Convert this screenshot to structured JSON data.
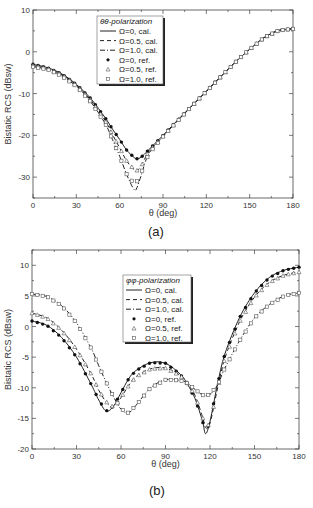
{
  "chart_data": [
    {
      "type": "line",
      "caption": "(a)",
      "xlabel": "θ (deg)",
      "ylabel": "Bistatic RCS (dBsw)",
      "xlim": [
        0,
        180
      ],
      "ylim": [
        -35,
        10
      ],
      "xticks": [
        0,
        30,
        60,
        90,
        120,
        150,
        180
      ],
      "yticks": [
        -30,
        -20,
        -10,
        0,
        10
      ],
      "legend_title": "θθ-polarization",
      "legend": [
        "Ω=0,   cal.",
        "Ω=0.5, cal.",
        "Ω=1.0, cal.",
        "Ω=0,   ref.",
        "Ω=0.5, ref.",
        "Ω=1.0, ref."
      ],
      "x": [
        0,
        10,
        20,
        30,
        40,
        50,
        55,
        60,
        65,
        70,
        72,
        75,
        80,
        90,
        100,
        110,
        120,
        130,
        140,
        150,
        160,
        170,
        180
      ],
      "series": [
        {
          "name": "Ω=0, cal.",
          "style": "solid",
          "values": [
            -3,
            -3.8,
            -5.3,
            -7.8,
            -11.2,
            -15.8,
            -18.5,
            -21,
            -23.6,
            -25.3,
            -25.6,
            -25.2,
            -23.5,
            -20,
            -16.4,
            -12.9,
            -9.4,
            -5.9,
            -2.5,
            0.6,
            3.4,
            5.1,
            5.5
          ]
        },
        {
          "name": "Ω=0.5, cal.",
          "style": "dash",
          "values": [
            -3.3,
            -4,
            -5.5,
            -8,
            -11.6,
            -16.5,
            -19.8,
            -23,
            -26.2,
            -28.2,
            -28.4,
            -27.3,
            -24,
            -20.2,
            -16.5,
            -13,
            -9.5,
            -6,
            -2.5,
            0.6,
            3.4,
            5.1,
            5.5
          ]
        },
        {
          "name": "Ω=1.0, cal.",
          "style": "dashdot",
          "values": [
            -3.6,
            -4.2,
            -5.8,
            -8.3,
            -12,
            -17.2,
            -21,
            -25,
            -29.5,
            -33,
            -32.5,
            -29.5,
            -24.5,
            -20.3,
            -16.6,
            -13,
            -9.5,
            -6,
            -2.5,
            0.6,
            3.4,
            5.1,
            5.5
          ]
        },
        {
          "name": "Ω=0, ref.",
          "marker": "filled-circle",
          "values": [
            -3,
            -3.8,
            -5.3,
            -7.8,
            -11.2,
            -15.8,
            -18.5,
            -21,
            -23.6,
            -25.3,
            -25.6,
            -25.2,
            -23.5,
            -20,
            -16.4,
            -12.9,
            -9.4,
            -5.9,
            -2.5,
            0.6,
            3.4,
            5.1,
            5.5
          ]
        },
        {
          "name": "Ω=0.5, ref.",
          "marker": "triangle",
          "values": [
            -3.3,
            -4,
            -5.5,
            -8,
            -11.6,
            -16.5,
            -19.8,
            -23,
            -26.2,
            -28.2,
            -28.4,
            -27.3,
            -24,
            -20.2,
            -16.5,
            -13,
            -9.5,
            -6,
            -2.5,
            0.6,
            3.4,
            5.1,
            5.5
          ]
        },
        {
          "name": "Ω=1.0, ref.",
          "marker": "square",
          "values": [
            -3.6,
            -4.2,
            -5.8,
            -8.3,
            -12,
            -17.2,
            -21,
            -25,
            -29.5,
            -31.5,
            -31,
            -29,
            -24.5,
            -20.3,
            -16.6,
            -13,
            -9.5,
            -6,
            -2.5,
            0.6,
            3.4,
            5.1,
            5.5
          ]
        }
      ]
    },
    {
      "type": "line",
      "caption": "(b)",
      "xlabel": "θ (deg)",
      "ylabel": "Bistatic RCS (dBsw)",
      "xlim": [
        0,
        180
      ],
      "ylim": [
        -20,
        12.5
      ],
      "xticks": [
        0,
        30,
        60,
        90,
        120,
        150,
        180
      ],
      "yticks": [
        -20,
        -15,
        -10,
        -5,
        0,
        5,
        10
      ],
      "legend_title": "φφ-polarization",
      "legend": [
        "Ω=0,   cal.",
        "Ω=0.5, cal.",
        "Ω=1.0, cal.",
        "Ω=0,   ref.",
        "Ω=0.5, ref.",
        "Ω=1.0, ref."
      ],
      "x": [
        0,
        10,
        20,
        30,
        40,
        45,
        50,
        55,
        60,
        65,
        70,
        80,
        90,
        100,
        105,
        110,
        115,
        117,
        120,
        125,
        130,
        140,
        150,
        160,
        170,
        180
      ],
      "series": [
        {
          "name": "Ω=0, cal.",
          "style": "solid",
          "values": [
            0.9,
            0.2,
            -1.8,
            -5,
            -9.5,
            -12,
            -13.8,
            -13,
            -10.8,
            -8.6,
            -7.2,
            -5.9,
            -6,
            -7.8,
            -9.5,
            -11.8,
            -15.5,
            -17.5,
            -15.5,
            -9.5,
            -4.5,
            1.5,
            5.5,
            8,
            9.2,
            9.7
          ]
        },
        {
          "name": "Ω=0.5, cal.",
          "style": "dash",
          "values": [
            2.2,
            1.4,
            -0.6,
            -3.7,
            -7.8,
            -10.4,
            -12.3,
            -13.2,
            -11.6,
            -9.7,
            -8.2,
            -6.9,
            -6.8,
            -8,
            -9.3,
            -11.3,
            -14.8,
            -16.5,
            -15.8,
            -10.2,
            -5.2,
            0.8,
            4.8,
            7.2,
            8.4,
            8.9
          ]
        },
        {
          "name": "Ω=1.0, cal.",
          "style": "dashdot",
          "values": [
            5.3,
            4.9,
            3.4,
            0.6,
            -3.6,
            -6.4,
            -9.1,
            -11.5,
            -13.5,
            -14.1,
            -12.9,
            -10,
            -8.7,
            -8.8,
            -9.3,
            -10.3,
            -11.2,
            -11.3,
            -11.1,
            -9.6,
            -6.8,
            -2.3,
            1.4,
            3.6,
            5,
            5.5
          ]
        },
        {
          "name": "Ω=0, ref.",
          "marker": "filled-circle",
          "values": [
            0.9,
            0.2,
            -1.8,
            -5,
            -9.5,
            -12,
            -13.8,
            -13,
            -10.8,
            -8.6,
            -7.2,
            -5.9,
            -6,
            -7.8,
            -9.5,
            -11.8,
            -15.5,
            -17.5,
            -15.5,
            -9.5,
            -4.5,
            1.5,
            5.5,
            8,
            9.2,
            9.7
          ]
        },
        {
          "name": "Ω=0.5, ref.",
          "marker": "triangle",
          "values": [
            2.2,
            1.4,
            -0.6,
            -3.7,
            -7.8,
            -10.4,
            -12.3,
            -13.2,
            -11.6,
            -9.7,
            -8.2,
            -6.9,
            -6.8,
            -8,
            -9.3,
            -11.3,
            -14.8,
            -16.5,
            -15.8,
            -10.2,
            -5.2,
            0.8,
            4.8,
            7.2,
            8.4,
            8.9
          ]
        },
        {
          "name": "Ω=1.0, ref.",
          "marker": "square",
          "values": [
            5.3,
            4.9,
            3.4,
            0.6,
            -3.6,
            -6.4,
            -9.1,
            -11.5,
            -13.5,
            -14.1,
            -12.9,
            -10,
            -8.7,
            -8.8,
            -9.3,
            -10.3,
            -11.2,
            -11.3,
            -11.1,
            -9.6,
            -6.8,
            -2.3,
            1.4,
            3.6,
            5,
            5.5
          ]
        }
      ]
    }
  ],
  "captions": {
    "a": "(a)",
    "b": "(b)"
  },
  "colors": {
    "line": "#222222",
    "marker": "#555555",
    "axis": "#444444"
  }
}
